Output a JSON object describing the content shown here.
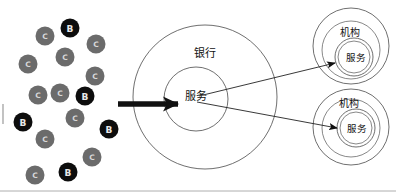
{
  "diagram": {
    "background_color": "#ffffff",
    "colors": {
      "node_b_fill": "#0d0d0d",
      "node_b_text": "#e8e8e8",
      "node_c_fill": "#6b6b6b",
      "node_c_text": "#d8d8d8",
      "ring_stroke": "#4a4a4a",
      "arrow_thick": "#111111",
      "arrow_thin": "#222222",
      "frame": "#9a9a9a"
    },
    "client_cluster": {
      "name": "client-cluster",
      "node_radius": 9.5,
      "nodes": [
        {
          "label": "C",
          "type": "C",
          "cx": 45,
          "cy": 36
        },
        {
          "label": "B",
          "type": "B",
          "cx": 70,
          "cy": 28
        },
        {
          "label": "C",
          "type": "C",
          "cx": 96,
          "cy": 44
        },
        {
          "label": "C",
          "type": "C",
          "cx": 65,
          "cy": 57
        },
        {
          "label": "C",
          "type": "C",
          "cx": 28,
          "cy": 64
        },
        {
          "label": "C",
          "type": "C",
          "cx": 95,
          "cy": 76
        },
        {
          "label": "C",
          "type": "C",
          "cx": 38,
          "cy": 95
        },
        {
          "label": "C",
          "type": "C",
          "cx": 60,
          "cy": 93
        },
        {
          "label": "B",
          "type": "B",
          "cx": 85,
          "cy": 96
        },
        {
          "label": "B",
          "type": "B",
          "cx": 23,
          "cy": 122
        },
        {
          "label": "C",
          "type": "C",
          "cx": 75,
          "cy": 118
        },
        {
          "label": "B",
          "type": "B",
          "cx": 109,
          "cy": 129
        },
        {
          "label": "C",
          "type": "C",
          "cx": 45,
          "cy": 139
        },
        {
          "label": "C",
          "type": "C",
          "cx": 92,
          "cy": 157
        },
        {
          "label": "B",
          "type": "B",
          "cx": 68,
          "cy": 172
        },
        {
          "label": "C",
          "type": "C",
          "cx": 35,
          "cy": 175
        }
      ]
    },
    "bank": {
      "name": "bank-group",
      "outer_label": "银行",
      "inner_label": "服务",
      "outer": {
        "cx": 205,
        "cy": 97,
        "r": 72
      },
      "inner": {
        "cx": 196,
        "cy": 99,
        "r": 32
      },
      "outer_label_pos": {
        "x": 205,
        "y": 53
      },
      "inner_label_pos": {
        "x": 196,
        "y": 96
      }
    },
    "institutions": [
      {
        "name": "institution-top",
        "outer_label": "机构",
        "inner_label": "服务",
        "outer": {
          "cx": 351,
          "cy": 46,
          "r": 38
        },
        "middle": {
          "cx": 351,
          "cy": 50,
          "r": 29
        },
        "inner": {
          "cx": 354,
          "cy": 57,
          "r": 19
        },
        "inner2": {
          "cx": 354,
          "cy": 57,
          "r": 16
        },
        "outer_label_pos": {
          "x": 350,
          "y": 32
        },
        "inner_label_pos": {
          "x": 356,
          "y": 57
        }
      },
      {
        "name": "institution-bottom",
        "outer_label": "机构",
        "inner_label": "服务",
        "outer": {
          "cx": 351,
          "cy": 127,
          "r": 38
        },
        "middle": {
          "cx": 351,
          "cy": 128,
          "r": 29
        },
        "inner": {
          "cx": 356,
          "cy": 128,
          "r": 19
        },
        "inner2": {
          "cx": 356,
          "cy": 128,
          "r": 16
        },
        "outer_label_pos": {
          "x": 349,
          "y": 103
        },
        "inner_label_pos": {
          "x": 357,
          "y": 128
        }
      }
    ],
    "arrows": {
      "main_inbound": {
        "name": "main-request-arrow",
        "from": {
          "x": 118,
          "y": 104
        },
        "to": {
          "x": 178,
          "y": 104
        }
      },
      "to_institutions": [
        {
          "name": "arrow-to-institution-top",
          "from": {
            "x": 199,
            "y": 96
          },
          "to": {
            "x": 335,
            "y": 63
          }
        },
        {
          "name": "arrow-to-institution-bottom",
          "from": {
            "x": 197,
            "y": 102
          },
          "to": {
            "x": 337,
            "y": 128
          }
        }
      ]
    },
    "frame": {
      "name": "bottom-frame-line",
      "bottom_y": 191,
      "left_mark": {
        "x": 3,
        "y1": 104,
        "y2": 124
      }
    }
  }
}
